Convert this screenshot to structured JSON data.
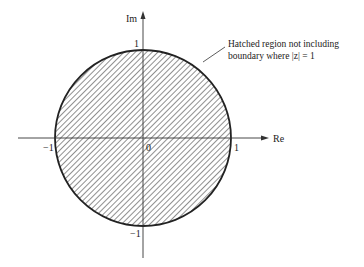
{
  "diagram": {
    "axes": {
      "real_label": "Re",
      "imag_label": "Im"
    },
    "ticks": {
      "real_pos": "1",
      "real_neg": "−1",
      "imag_pos": "1",
      "imag_neg": "−1",
      "origin": "0"
    },
    "annotation": {
      "line1": "Hatched region not including",
      "line2": "boundary where |z| = 1"
    },
    "region": {
      "shape": "disk",
      "radius": 1,
      "fill": "hatched",
      "boundary_included": false
    },
    "colors": {
      "ink": "#222222",
      "background": "#ffffff"
    }
  }
}
